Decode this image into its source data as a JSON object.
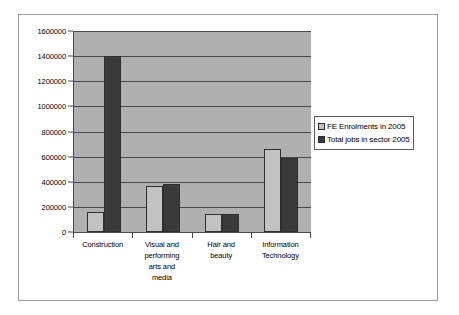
{
  "chart_data": {
    "type": "bar",
    "title": "",
    "xlabel": "",
    "ylabel": "",
    "ylim": [
      0,
      1600000
    ],
    "grid": true,
    "legend_position": "top-right-outside",
    "categories": [
      "Construction",
      "Visual and performing arts and media",
      "Hair and beauty",
      "Information Technology"
    ],
    "category_lines": [
      [
        "Construction"
      ],
      [
        "Visual and",
        "performing",
        "arts and",
        "media"
      ],
      [
        "Hair and",
        "beauty"
      ],
      [
        "Information",
        "Technology"
      ]
    ],
    "y_ticks": [
      0,
      200000,
      400000,
      600000,
      800000,
      1000000,
      1200000,
      1400000,
      1600000
    ],
    "y_tick_labels": [
      "0",
      "200000",
      "400000",
      "600000",
      "800000",
      "1000000",
      "1200000",
      "1400000",
      "1600000"
    ],
    "series": [
      {
        "name": "FE Enrolments in 2005",
        "color": "#c2c2c2",
        "values": [
          160000,
          365000,
          140000,
          660000
        ]
      },
      {
        "name": "Total jobs in sector 2005",
        "color": "#3a3a3a",
        "values": [
          1400000,
          380000,
          140000,
          590000
        ]
      }
    ]
  },
  "legend": {
    "items": [
      {
        "label": "FE Enrolments in 2005"
      },
      {
        "label": "Total jobs in sector 2005"
      }
    ]
  }
}
